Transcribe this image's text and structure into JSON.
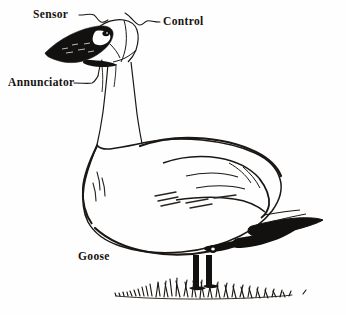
{
  "figure": {
    "subject": "goose",
    "style": "pen-and-ink line drawing",
    "background_color": "#fefefe",
    "ink_color": "#15120f"
  },
  "annotations": [
    {
      "id": "sensor",
      "label": "Sensor",
      "x": 33,
      "y": 9,
      "points_to": "head-top",
      "leader": "curved line to top of head"
    },
    {
      "id": "control",
      "label": "Control",
      "x": 163,
      "y": 16,
      "points_to": "crown-rear",
      "leader": "curved line to rear of crown"
    },
    {
      "id": "annunciator",
      "label": "Annunciator",
      "x": 8,
      "y": 77,
      "points_to": "throat",
      "leader": "bracket line to throat"
    },
    {
      "id": "goose",
      "label": "Goose",
      "x": 78,
      "y": 251,
      "points_to": "body",
      "leader": "none"
    }
  ],
  "parts": {
    "head_icon": "goose-head-icon",
    "beak_icon": "beak-icon",
    "eye_icon": "eye-icon",
    "cheek_icon": "cheek-patch-icon",
    "neck_icon": "neck-icon",
    "body_icon": "body-icon",
    "wing_icon": "wing-icon",
    "tail_icon": "tail-icon",
    "legs_icon": "legs-icon",
    "grass_icon": "grass-icon"
  },
  "colors": {
    "ink": "#15120f",
    "fill_black": "#121110",
    "paper": "#fefefe",
    "hatch": "#3a3530"
  }
}
